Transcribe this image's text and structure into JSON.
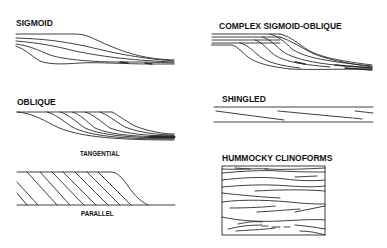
{
  "figure": {
    "panels": [
      {
        "id": "sigmoid",
        "title": "SIGMOID"
      },
      {
        "id": "complex-sigmoid-oblique",
        "title": "COMPLEX SIGMOID-OBLIQUE"
      },
      {
        "id": "oblique",
        "title": "OBLIQUE",
        "sub_panels": [
          {
            "id": "tangential",
            "caption": "TANGENTIAL"
          },
          {
            "id": "parallel",
            "caption": "PARALLEL"
          }
        ]
      },
      {
        "id": "shingled",
        "title": "SHINGLED"
      },
      {
        "id": "hummocky-clinoforms",
        "title": "HUMMOCKY CLINOFORMS"
      }
    ],
    "colors": {
      "line": "#2a2a2a",
      "background": "#ffffff",
      "text": "#111111"
    }
  }
}
